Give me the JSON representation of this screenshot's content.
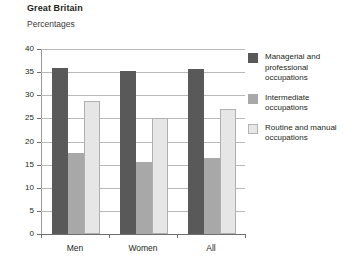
{
  "header": {
    "title": "Great Britain",
    "subtitle": "Percentages"
  },
  "chart_data": {
    "type": "bar",
    "title": "Great Britain",
    "subtitle": "Percentages",
    "xlabel": "",
    "ylabel": "Percentages",
    "ylim": [
      0,
      40
    ],
    "yticks": [
      0,
      5,
      10,
      15,
      20,
      25,
      30,
      35,
      40
    ],
    "grid": true,
    "legend_position": "right",
    "categories": [
      "Men",
      "Women",
      "All"
    ],
    "series": [
      {
        "name": "Managerial and professional occupations",
        "color": "#595959",
        "values": [
          36.0,
          35.2,
          35.6
        ]
      },
      {
        "name": "Intermediate occupations",
        "color": "#a8a8a8",
        "values": [
          17.5,
          15.5,
          16.4
        ]
      },
      {
        "name": "Routine and manual occupations",
        "color": "#e6e6e6",
        "values": [
          28.8,
          25.1,
          27.0
        ]
      }
    ]
  },
  "legend": {
    "items": [
      {
        "label": "Managerial and professional occupations",
        "color": "#595959"
      },
      {
        "label": "Intermediate occupations",
        "color": "#a8a8a8"
      },
      {
        "label": "Routine and manual occupations",
        "color": "#e6e6e6"
      }
    ]
  }
}
